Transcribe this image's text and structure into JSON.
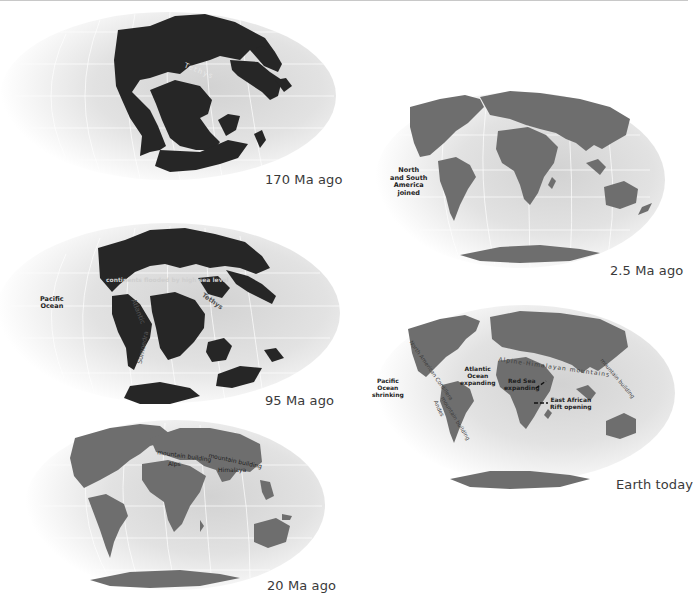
{
  "figure": {
    "colors": {
      "ocean_light": "#f2f2f2",
      "ocean_dark": "#c8c8c8",
      "land_old": "#262626",
      "land_young": "#6e6e6e",
      "graticule": "#ffffff",
      "caption": "#3a3a3a"
    }
  },
  "maps": [
    {
      "id": "map-170",
      "caption": "170 Ma ago",
      "labels": [
        {
          "text": "Tethys"
        }
      ]
    },
    {
      "id": "map-95",
      "caption": "95 Ma ago",
      "labels": [
        {
          "text": "Pacific\nOcean"
        },
        {
          "text": "continents flooded by high sea level"
        },
        {
          "text": "Atlantic"
        },
        {
          "text": "Tethys"
        },
        {
          "text": "Sumoedra"
        }
      ]
    },
    {
      "id": "map-20",
      "caption": "20 Ma ago",
      "labels": [
        {
          "text": "mountain building"
        },
        {
          "text": "Alps"
        },
        {
          "text": "mountain building"
        },
        {
          "text": "Himalaya"
        }
      ]
    },
    {
      "id": "map-2-5",
      "caption": "2.5 Ma ago",
      "labels": [
        {
          "text": "North\nand South\nAmerica\njoined"
        }
      ]
    },
    {
      "id": "map-today",
      "caption": "Earth today",
      "labels": [
        {
          "text": "Pacific\nOcean\nshrinking"
        },
        {
          "text": "Atlantic\nOcean\nexpanding"
        },
        {
          "text": "Red Sea\nexpanding"
        },
        {
          "text": "East African\nRift opening"
        },
        {
          "text": "Alpine-Himalayan mountains"
        },
        {
          "text": "North American Cordillera"
        },
        {
          "text": "Andes"
        },
        {
          "text": "mountain building"
        },
        {
          "text": "mountain building"
        }
      ]
    }
  ]
}
